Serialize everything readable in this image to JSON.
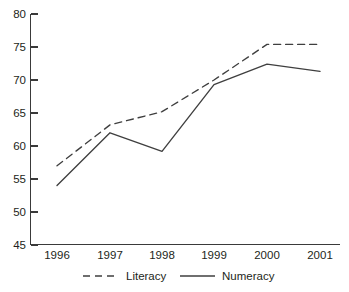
{
  "chart_data": {
    "type": "line",
    "title": "",
    "subtitle": "",
    "xlabel": "",
    "ylabel": "",
    "categories": [
      "1996",
      "1997",
      "1998",
      "1999",
      "2000",
      "2001"
    ],
    "x_tick_labels": [
      "1996",
      "1997",
      "1998",
      "1999",
      "2000",
      "2001"
    ],
    "y_tick_labels": [
      "45",
      "50",
      "55",
      "60",
      "65",
      "70",
      "75",
      "80"
    ],
    "y_ticks": [
      45,
      50,
      55,
      60,
      65,
      70,
      75,
      80
    ],
    "ylim": [
      45,
      80
    ],
    "grid": false,
    "legend_position": "bottom",
    "series": [
      {
        "name": "Literacy",
        "style": "dashed",
        "color": "#3f3f3f",
        "values": [
          57.0,
          63.2,
          65.2,
          70.0,
          75.4,
          75.4
        ]
      },
      {
        "name": "Numeracy",
        "style": "solid",
        "color": "#3f3f3f",
        "values": [
          54.0,
          62.0,
          59.2,
          69.3,
          72.4,
          71.3
        ]
      }
    ],
    "legend": [
      {
        "label": "Literacy",
        "style": "dashed"
      },
      {
        "label": "Numeracy",
        "style": "solid"
      }
    ]
  },
  "axes": {
    "y": {
      "t0": "80",
      "t1": "75",
      "t2": "70",
      "t3": "65",
      "t4": "60",
      "t5": "55",
      "t6": "50",
      "t7": "45"
    },
    "x": {
      "t0": "1996",
      "t1": "1997",
      "t2": "1998",
      "t3": "1999",
      "t4": "2000",
      "t5": "2001"
    }
  },
  "legend": {
    "literacy": "Literacy",
    "numeracy": "Numeracy"
  }
}
